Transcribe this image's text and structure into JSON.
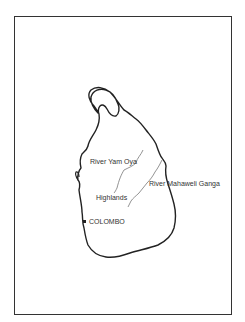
{
  "map": {
    "title": "",
    "region": "Sri Lanka",
    "labels": {
      "river_yam_oya": "River Yam Oya",
      "river_mahaweli": "River Mahaweli Ganga",
      "highlands": "Highlands",
      "colombo": "COLOMBO"
    },
    "colors": {
      "outline": "#222222",
      "river": "#777777",
      "frame": "#333333",
      "text": "#333333"
    }
  }
}
